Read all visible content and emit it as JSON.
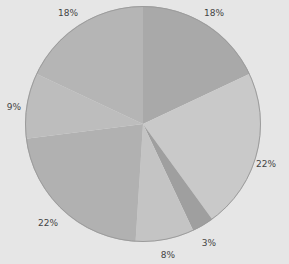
{
  "chart_data": {
    "type": "pie",
    "title": "",
    "start_angle_deg": 0,
    "direction": "clockwise",
    "slices": [
      {
        "label": "18%",
        "value": 18,
        "color": "#a9a9a9"
      },
      {
        "label": "22%",
        "value": 22,
        "color": "#c9c9c9"
      },
      {
        "label": "3%",
        "value": 3,
        "color": "#9f9f9f"
      },
      {
        "label": "8%",
        "value": 8,
        "color": "#c4c4c4"
      },
      {
        "label": "22%",
        "value": 22,
        "color": "#b1b1b1"
      },
      {
        "label": "9%",
        "value": 9,
        "color": "#bdbdbd"
      },
      {
        "label": "18%",
        "value": 18,
        "color": "#b5b5b5"
      }
    ],
    "values": [
      18,
      22,
      3,
      8,
      22,
      9,
      18
    ],
    "categories": [
      "18%",
      "22%",
      "3%",
      "8%",
      "22%",
      "9%",
      "18%"
    ],
    "legend": "none"
  },
  "labels": {
    "l0": "18%",
    "l1": "22%",
    "l2": "3%",
    "l3": "8%",
    "l4": "22%",
    "l5": "9%",
    "l6": "18%"
  }
}
